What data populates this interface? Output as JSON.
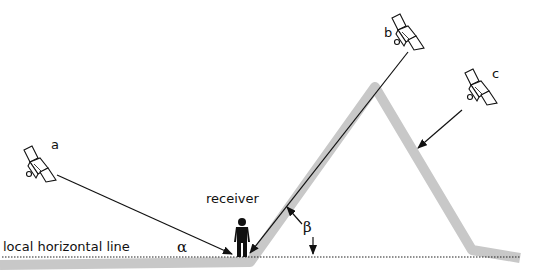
{
  "diagram": {
    "labels": {
      "satellite_a": "a",
      "satellite_b": "b",
      "satellite_c": "c",
      "receiver": "receiver",
      "horizon": "local horizontal line",
      "alpha": "α",
      "beta": "β"
    },
    "colors": {
      "terrain": "#c8c8c8",
      "lines": "#111111",
      "background": "#ffffff"
    }
  }
}
